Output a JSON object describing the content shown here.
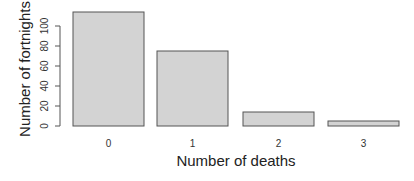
{
  "chart_data": {
    "type": "bar",
    "title": "",
    "xlabel": "Number of deaths",
    "ylabel": "Number of fortnights",
    "categories": [
      "0",
      "1",
      "2",
      "3"
    ],
    "values": [
      114,
      75,
      14,
      5
    ],
    "ylim": [
      0,
      114
    ],
    "yticks": [
      0,
      20,
      40,
      60,
      80,
      100
    ],
    "grid": false,
    "legend": null,
    "colors": {
      "bar_fill": "#d3d3d3",
      "bar_border": "#555555"
    }
  }
}
